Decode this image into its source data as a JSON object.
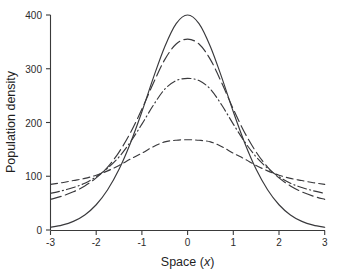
{
  "chart_data": {
    "type": "line",
    "title": "",
    "xlabel": "Space (x)",
    "ylabel": "Population density",
    "xlim": [
      -3,
      3
    ],
    "ylim": [
      0,
      400
    ],
    "xticks": [
      -3,
      -2,
      -1,
      0,
      1,
      2,
      3
    ],
    "xtick_labels": [
      "-3",
      "-2",
      "-1",
      "0",
      "1",
      "2",
      "3"
    ],
    "yticks": [
      0,
      100,
      200,
      300,
      400
    ],
    "ytick_labels": [
      "0",
      "100",
      "200",
      "300",
      "400"
    ],
    "grid": false,
    "legend": "none",
    "crossing_points": [
      {
        "x": -1.65,
        "y": 100
      },
      {
        "x": 1.65,
        "y": 100
      }
    ],
    "x": [
      -3,
      -2.75,
      -2.5,
      -2.25,
      -2,
      -1.75,
      -1.5,
      -1.25,
      -1,
      -0.75,
      -0.5,
      -0.25,
      0,
      0.25,
      0.5,
      0.75,
      1,
      1.25,
      1.5,
      1.75,
      2,
      2.25,
      2.5,
      2.75,
      3
    ],
    "series": [
      {
        "name": "curve-1",
        "style": "solid",
        "peak": 400,
        "edge_value": 5,
        "values": [
          5,
          9,
          16,
          28,
          47,
          75,
          113,
          162,
          220,
          283,
          341,
          384,
          400,
          384,
          341,
          283,
          220,
          162,
          113,
          75,
          47,
          28,
          16,
          9,
          5
        ]
      },
      {
        "name": "curve-2",
        "style": "long-dash",
        "peak": 355,
        "edge_value": 57,
        "values": [
          57,
          63,
          71,
          82,
          97,
          117,
          145,
          181,
          225,
          273,
          317,
          346,
          355,
          346,
          317,
          273,
          225,
          181,
          145,
          117,
          97,
          82,
          71,
          63,
          57
        ]
      },
      {
        "name": "curve-3",
        "style": "dash-dot",
        "peak": 282,
        "edge_value": 68,
        "values": [
          68,
          73,
          79,
          87,
          99,
          115,
          136,
          164,
          197,
          232,
          262,
          278,
          282,
          278,
          262,
          232,
          197,
          164,
          136,
          115,
          99,
          87,
          79,
          73,
          68
        ]
      },
      {
        "name": "curve-4",
        "style": "dashed",
        "peak": 168,
        "edge_value": 85,
        "values": [
          85,
          88,
          92,
          96,
          102,
          110,
          120,
          132,
          143,
          155,
          164,
          167,
          168,
          167,
          164,
          155,
          143,
          132,
          120,
          110,
          102,
          96,
          92,
          88,
          85
        ]
      }
    ]
  },
  "axes": {
    "x_title_main": "Space (",
    "x_title_var": "x",
    "x_title_close": ")",
    "y_title": "Population density"
  }
}
